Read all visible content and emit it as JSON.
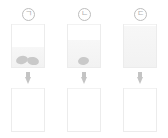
{
  "diagram": {
    "title": "",
    "type": "science-experiment-comparison",
    "columns": [
      {
        "label": "ㄱ",
        "label_name": "circled-giyeok",
        "top_beaker": {
          "liquid_level_percent": 46,
          "objects_count": 2,
          "object_shape": "bean",
          "object_color": "#c9c9c9"
        },
        "arrow": "down-arrow",
        "bottom_beaker": {
          "liquid_level_percent": 0,
          "objects_count": 0
        }
      },
      {
        "label": "ㄴ",
        "label_name": "circled-nieun",
        "top_beaker": {
          "liquid_level_percent": 62,
          "objects_count": 1,
          "object_shape": "bean",
          "object_color": "#c9c9c9"
        },
        "arrow": "down-arrow",
        "bottom_beaker": {
          "liquid_level_percent": 0,
          "objects_count": 0
        }
      },
      {
        "label": "ㄷ",
        "label_name": "circled-digeut",
        "top_beaker": {
          "liquid_level_percent": 96,
          "objects_count": 0,
          "object_shape": "bean",
          "object_color": "#c9c9c9"
        },
        "arrow": "down-arrow",
        "bottom_beaker": {
          "liquid_level_percent": 0,
          "objects_count": 0
        }
      }
    ],
    "colors": {
      "background": "#ffffff",
      "beaker_outline": "#ececec",
      "liquid": "#f2f2f2",
      "object": "#c9c9c9",
      "arrow": "#c4c4c4",
      "label_text": "#b0b0b0"
    }
  }
}
